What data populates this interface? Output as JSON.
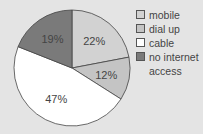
{
  "chart_data": {
    "type": "pie",
    "title": "",
    "categories": [
      "mobile",
      "dial up",
      "cable",
      "no internet access"
    ],
    "values": [
      22,
      12,
      47,
      19
    ],
    "labels": [
      "22%",
      "12%",
      "47%",
      "19%"
    ],
    "colors": [
      "#d2d2d2",
      "#c4c4c4",
      "#ffffff",
      "#7a7a7a"
    ],
    "start_angle": "12 o'clock",
    "direction": "clockwise",
    "legend_position": "right"
  },
  "legend": [
    {
      "label": "mobile",
      "color": "#d2d2d2"
    },
    {
      "label": "dial up",
      "color": "#c4c4c4"
    },
    {
      "label": "cable",
      "color": "#ffffff"
    },
    {
      "label": "no internet access",
      "color": "#7a7a7a"
    }
  ]
}
